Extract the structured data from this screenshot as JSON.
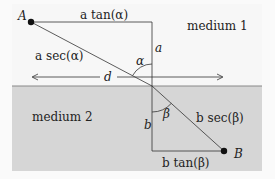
{
  "diagram": {
    "type": "refraction-geometry",
    "regions": {
      "medium1": {
        "label": "medium 1",
        "color": "#f7f7f7"
      },
      "medium2": {
        "label": "medium 2",
        "color": "#d6d6d6"
      }
    },
    "points": {
      "A": {
        "label": "A"
      },
      "B": {
        "label": "B"
      }
    },
    "labels": {
      "a_tan": "a tan(α)",
      "a_sec": "a sec(α)",
      "a": "a",
      "alpha": "α",
      "d": "d",
      "beta": "β",
      "b": "b",
      "b_sec": "b sec(β)",
      "b_tan": "b tan(β)"
    }
  }
}
